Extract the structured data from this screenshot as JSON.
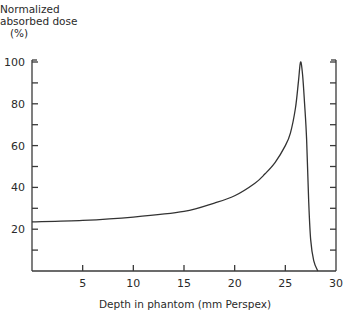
{
  "chart_data": {
    "type": "line",
    "title": "",
    "ylabel_lines": [
      "Normalized",
      "absorbed dose",
      "(%)"
    ],
    "xlabel": "Depth in phantom (mm Perspex)",
    "xlim": [
      0,
      30
    ],
    "ylim": [
      0,
      100
    ],
    "x_ticks": [
      5,
      10,
      15,
      20,
      25,
      30
    ],
    "x_tick_labels": [
      "5",
      "10",
      "15",
      "20",
      "25",
      "30"
    ],
    "y_ticks": [
      20,
      40,
      60,
      80,
      100
    ],
    "y_tick_labels": [
      "20",
      "40",
      "60",
      "80",
      "100"
    ],
    "y_minor_step": 10,
    "grid": false,
    "legend": "none",
    "series": [
      {
        "name": "Bragg curve",
        "x": [
          0,
          5,
          10,
          15,
          18,
          20,
          22,
          23,
          24,
          25,
          25.5,
          26,
          26.3,
          26.5,
          26.7,
          26.9,
          27.1,
          27.3,
          27.5,
          27.8,
          28.2
        ],
        "y": [
          23.5,
          24.2,
          25.8,
          28.5,
          32.5,
          36,
          42,
          46.5,
          52,
          60,
          66,
          78,
          91,
          100,
          94,
          80,
          63,
          34,
          15,
          5,
          0
        ]
      }
    ]
  }
}
